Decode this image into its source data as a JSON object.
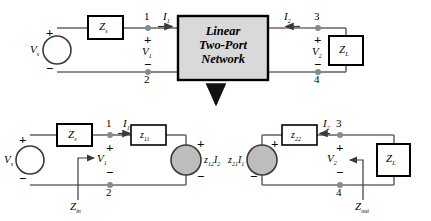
{
  "figure": {
    "title_block": {
      "line1": "Linear",
      "line2": "Two-Port",
      "line3": "Network"
    },
    "transition_arrow": "down-arrow"
  },
  "colors": {
    "wire": "#6b6b6b",
    "box_border": "#000000",
    "box_fill": "#ffffff",
    "network_fill": "#d9d9d9",
    "source_fill": "#bdbdbd",
    "node_dot": "#8a8a8a",
    "text": "#000000"
  },
  "top_circuit": {
    "source": {
      "symbol": "V",
      "subscript": "s",
      "plus": "+",
      "minus": "−"
    },
    "series_impedance": {
      "symbol": "Z",
      "subscript": "s"
    },
    "load_impedance": {
      "symbol": "Z",
      "subscript": "L"
    },
    "port1": {
      "node_top": "1",
      "node_bottom": "2",
      "current": {
        "symbol": "I",
        "subscript": "1"
      },
      "voltage": {
        "symbol": "V",
        "subscript": "1"
      },
      "plus": "+",
      "minus": "−"
    },
    "port2": {
      "node_top": "3",
      "node_bottom": "4",
      "current": {
        "symbol": "I",
        "subscript": "2"
      },
      "voltage": {
        "symbol": "V",
        "subscript": "2"
      },
      "plus": "+",
      "minus": "−"
    },
    "network_label": "Linear Two-Port Network"
  },
  "bottom_circuit": {
    "left": {
      "source": {
        "symbol": "V",
        "subscript": "s",
        "plus": "+",
        "minus": "−"
      },
      "series_impedance": {
        "symbol": "Z",
        "subscript": "s"
      },
      "z_parameter": {
        "symbol": "z",
        "subscript": "11"
      },
      "dependent_source": {
        "symbol": "z",
        "subscript": "12",
        "current": "I",
        "current_subscript": "2",
        "plus": "+",
        "minus": "−"
      },
      "node_top": "1",
      "node_bottom": "2",
      "current": {
        "symbol": "I",
        "subscript": "1"
      },
      "voltage": {
        "symbol": "V",
        "subscript": "1"
      },
      "plus": "+",
      "minus": "−",
      "impedance_marker": {
        "symbol": "Z",
        "subscript": "in"
      }
    },
    "right": {
      "load_impedance": {
        "symbol": "Z",
        "subscript": "L"
      },
      "z_parameter": {
        "symbol": "z",
        "subscript": "22"
      },
      "dependent_source": {
        "symbol": "z",
        "subscript": "21",
        "current": "I",
        "current_subscript": "1",
        "plus": "+",
        "minus": "−"
      },
      "node_top": "3",
      "node_bottom": "4",
      "current": {
        "symbol": "I",
        "subscript": "2"
      },
      "voltage": {
        "symbol": "V",
        "subscript": "2"
      },
      "plus": "+",
      "minus": "−",
      "impedance_marker": {
        "symbol": "Z",
        "subscript": "out"
      }
    }
  }
}
